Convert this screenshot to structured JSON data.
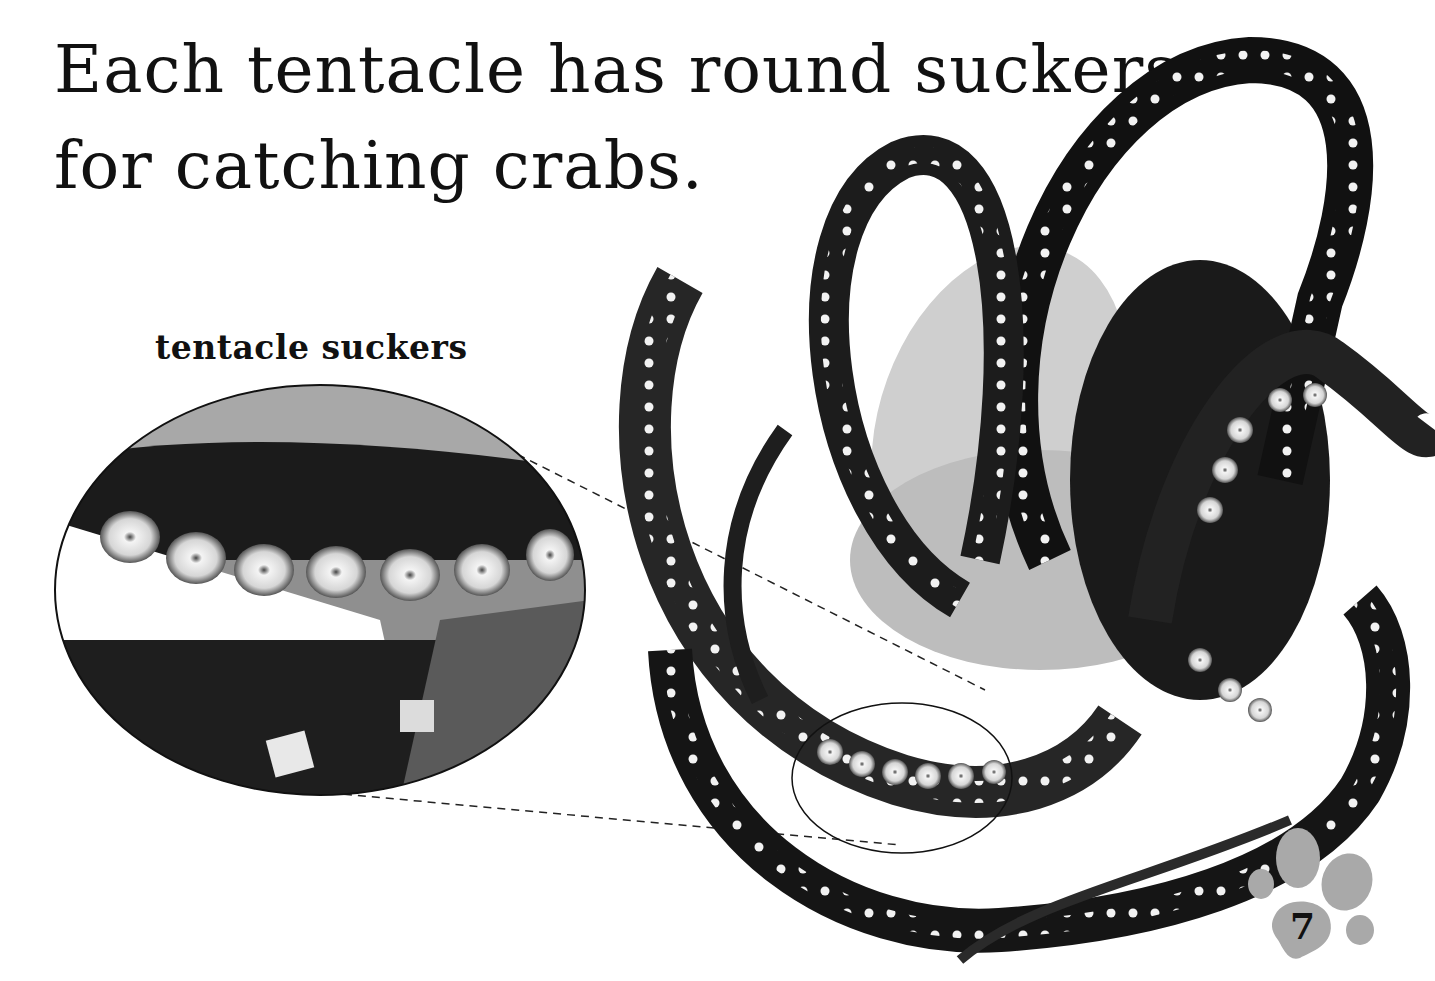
{
  "page": {
    "headline_line1": "Each tentacle has round suckers",
    "headline_line2": "for catching crabs.",
    "inset_label": "tentacle suckers",
    "page_number": "7"
  },
  "images": {
    "main_photo": "octopus-photo",
    "inset_photo": "tentacle-suckers-closeup",
    "page_badge": "paw-print-icon"
  },
  "colors": {
    "text": "#111111",
    "paw": "#a9a9a9",
    "background": "#ffffff"
  }
}
